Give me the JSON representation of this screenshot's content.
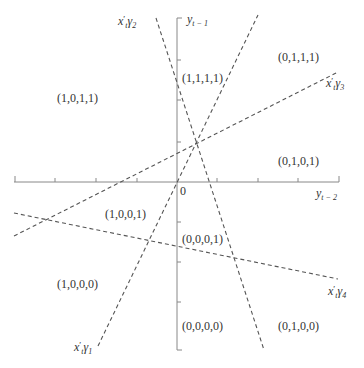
{
  "diagram": {
    "axes": {
      "x_label": "y",
      "x_label_sub": "t − 2",
      "y_label": "y",
      "y_label_sub": "t − 1",
      "origin_label": "0"
    },
    "lines": [
      {
        "id": "gamma1",
        "label_base": "x",
        "label_sub": "t",
        "label_prime": "′",
        "label_greek": "γ",
        "label_index": "1"
      },
      {
        "id": "gamma2",
        "label_base": "x",
        "label_sub": "t",
        "label_prime": "′",
        "label_greek": "γ",
        "label_index": "2"
      },
      {
        "id": "gamma3",
        "label_base": "x",
        "label_sub": "t",
        "label_prime": "′",
        "label_greek": "γ",
        "label_index": "3"
      },
      {
        "id": "gamma4",
        "label_base": "x",
        "label_sub": "t",
        "label_prime": "′",
        "label_greek": "γ",
        "label_index": "4"
      }
    ],
    "regions": [
      {
        "label": "(1,0,1,1)"
      },
      {
        "label": "(1,1,1,1)"
      },
      {
        "label": "(0,1,1,1)"
      },
      {
        "label": "(0,1,0,1)"
      },
      {
        "label": "(1,0,0,1)"
      },
      {
        "label": "(0,0,0,1)"
      },
      {
        "label": "(1,0,0,0)"
      },
      {
        "label": "(0,0,0,0)"
      },
      {
        "label": "(0,1,0,0)"
      }
    ],
    "colors": {
      "axis": "#888888",
      "dashed_line": "#555555",
      "text": "#333333"
    }
  }
}
